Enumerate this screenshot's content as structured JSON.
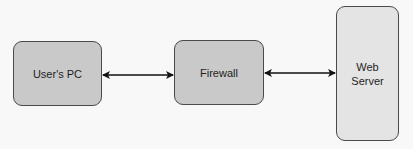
{
  "diagram": {
    "nodes": [
      {
        "id": "users-pc",
        "label": "User's PC",
        "fill": "#c9c9c9"
      },
      {
        "id": "firewall",
        "label": "Firewall",
        "fill": "#c9c9c9"
      },
      {
        "id": "web-server",
        "label": "Web\nServer",
        "fill": "#e4e4e4"
      }
    ],
    "edges": [
      {
        "from": "users-pc",
        "to": "firewall",
        "direction": "bidirectional"
      },
      {
        "from": "firewall",
        "to": "web-server",
        "direction": "bidirectional"
      }
    ],
    "colors": {
      "background": "#f8f8f8",
      "stroke": "#4a4a4a",
      "arrow": "#111111",
      "text": "#1e1e1e"
    }
  }
}
